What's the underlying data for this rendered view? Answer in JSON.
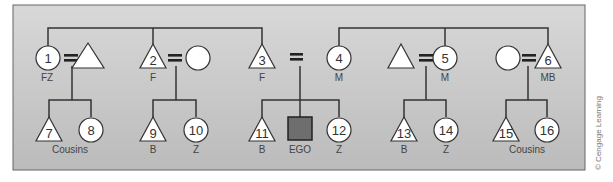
{
  "panel": {
    "bg_top": "#d6d6d6",
    "bg_bottom": "#bdbdbd",
    "border": "#555555"
  },
  "copyright": "© Cengage Learning",
  "symbols": {
    "male": "triangle",
    "female": "circle",
    "ego": "filled-square",
    "marriage": "="
  },
  "ego": {
    "label": "EGO",
    "fill": "#6e6e6e"
  },
  "generation1": [
    {
      "id": "1",
      "shape": "circle",
      "label": "FZ",
      "spouse": "triangle"
    },
    {
      "id": "2",
      "shape": "triangle",
      "label": "F",
      "spouse": "circle"
    },
    {
      "id": "3",
      "shape": "triangle",
      "label": "F",
      "spouse": null
    },
    {
      "id": "4",
      "shape": "circle",
      "label": "M",
      "spouse": null
    },
    {
      "id": "5",
      "shape": "circle",
      "label": "M",
      "spouse": "triangle"
    },
    {
      "id": "6",
      "shape": "triangle",
      "label": "MB",
      "spouse": "circle"
    }
  ],
  "generation2": [
    {
      "id": "7",
      "shape": "triangle",
      "label": ""
    },
    {
      "id": "8",
      "shape": "circle",
      "label": ""
    },
    {
      "id": "9",
      "shape": "triangle",
      "label": "B"
    },
    {
      "id": "10",
      "shape": "circle",
      "label": "Z"
    },
    {
      "id": "11",
      "shape": "triangle",
      "label": "B"
    },
    {
      "id": "EGO",
      "shape": "square",
      "label": "EGO"
    },
    {
      "id": "12",
      "shape": "circle",
      "label": "Z"
    },
    {
      "id": "13",
      "shape": "triangle",
      "label": "B"
    },
    {
      "id": "14",
      "shape": "circle",
      "label": "Z"
    },
    {
      "id": "15",
      "shape": "triangle",
      "label": ""
    },
    {
      "id": "16",
      "shape": "circle",
      "label": ""
    }
  ],
  "group_labels": {
    "left_cousins": "Cousins",
    "right_cousins": "Cousins"
  },
  "equals": "="
}
